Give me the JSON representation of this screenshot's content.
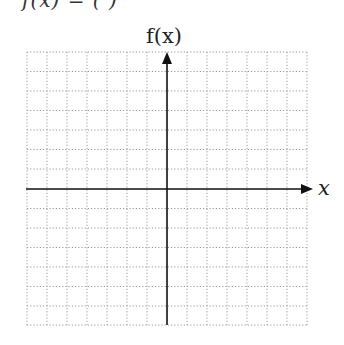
{
  "header": {
    "clipped_text": "f(x) = (           )"
  },
  "axes": {
    "y_label": "f(x)",
    "x_label": "x"
  },
  "grid": {
    "columns": 14,
    "rows": 14,
    "style": "dotted"
  },
  "colors": {
    "axis": "#111111",
    "grid": "#9a9a9a",
    "background": "#ffffff"
  }
}
